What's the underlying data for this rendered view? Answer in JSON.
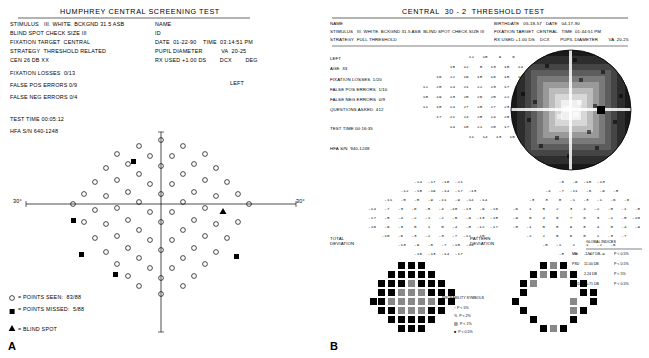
{
  "panelA": {
    "title": "HUMPHREY CENTRAL SCREENING TEST",
    "letter": "A",
    "lines_left": [
      "STIMULUS   III. WHITE. BCKGND 31.5 ASB",
      "BLIND SPOT CHECK SIZE III",
      "FIXATION TARGET  CENTRAL",
      "STRATEGY  THRESHOLD RELATED",
      "CEN 26 DB XX",
      "FALSE POS ERRORS 0/9",
      "FALSE NEG ERRORS 0/4",
      "TEST TIME 00:05:12",
      "HFA S/N 640-1248"
    ],
    "fixation_losses": "FIXATION LOSSES  0/13",
    "lines_right": [
      "NAME",
      "ID",
      "DATE  01-22-90    TIME  03:14:51 PM",
      "PUPIL DIAMETER           VA  20-25",
      "RX USED +1.00 DS        DCX        DEG",
      "LEFT"
    ],
    "axis_left_label": "30°",
    "axis_right_label": "30°",
    "legend": [
      {
        "symbol": "circle",
        "text": "= POINTS SEEN:  83/88"
      },
      {
        "symbol": "square",
        "text": "= POINTS MISSED:  5/88"
      },
      {
        "symbol": "triangle",
        "text": "= BLIND SPOT"
      }
    ]
  },
  "panelB": {
    "title": "CENTRAL  30 - 2  THRESHOLD TEST",
    "letter": "B",
    "header_left": [
      "NAME",
      "STIMULUS   III. WHITE. BCKGND 31.5 ASB  BLIND SPOT CHECK SIZE III",
      "STRATEGY  FULL THRESHOLD"
    ],
    "header_right": [
      "BIRTHDATE   05-18-57   DATE   04-17-90",
      "FIXATION TARGET  CENTRAL   TIME  01:44:51 PM",
      "RX USED +1.00 DS    DCX        PUPIL DIAMETER        VA  20-25"
    ],
    "stats_left": [
      "LEFT",
      "AGE  33",
      "FIXATION LOSSES  1/20",
      "FALSE POS ERRORS  1/10",
      "FALSE NEG ERRORS  0/9",
      "QUESTIONS ASKED  412",
      "TEST TIME 00:16:35",
      "HFA S/N  940-1248"
    ],
    "threshold_label": "THRESHOLD VALUES (dB)",
    "total_deviation_label": "TOTAL\nDEVIATION",
    "pattern_deviation_label": "PATTERN\nDEVIATION",
    "prob_symbols_label": "PROBABILITY SYMBOLS",
    "prob_symbols": [
      ":: P < 5%",
      "%  P < 2%",
      "▨  P < 1%",
      "■  P < 0.5%"
    ],
    "global_label": "GLOBAL INDICES",
    "global_indices": [
      {
        "name": "MD",
        "value": "-17.07 DB",
        "p": "P < 0.5%"
      },
      {
        "name": "PSD",
        "value": "11.00 DB",
        "p": "P < 0.5%"
      },
      {
        "name": "SF",
        "value": "2.24 DB",
        "p": "P < 5%"
      },
      {
        "name": "CPSD",
        "value": "10.71 DB",
        "p": "P < 0.5%"
      }
    ],
    "threshold_rows": [
      "                  12   10    9    6",
      "           15   12    8   13   10   14",
      "      16   22   19   18   16   18   13   13",
      " 12   20   24   21   22   23   17   14   18   11",
      " 10   19   23   25   26   25   22   18   14    9",
      " 11   18   24   27   28   27   23   19   15   10",
      "      17   21   24   25   24   20   16   12",
      "           14   18   21   20   17   13",
      "                  11   14   13   10"
    ],
    "total_dev_rows": [
      "                 -14  -17  -18  -21",
      "            -12  -15  -19  -14  -17  -13",
      "      -11   -5   -8   -9  -11   -9  -14  -14",
      "-14   -7   -3   -6   -5   -4  -10  -13   -9  -16",
      "-17   -8   -4   -2   -1   -2   -5   -9  -13  -18",
      "-16   -9   -3    0    1    0   -4   -8  -12  -17",
      "     -10   -6   -3   -2   -3   -7  -11  -15",
      "           -13   -9   -6   -7  -10  -14",
      "                 -16  -13  -14  -17"
    ],
    "pattern_dev_rows": [
      "                  -6   -9  -10  -13",
      "             -4   -7  -11   -6   -9   -5",
      "       -3    3    0   -1   -3   -1   -6   -6",
      " -6    1    5    2    3    4   -2   -5   -1   -8",
      " -9    0    4    6    7    6    3   -1   -5  -10",
      " -8   -1    5    8    9    8    4    0   -4   -9",
      "      -2    2    5    6    5    1   -3   -7",
      "            -5   -1    2    1   -2   -6",
      "                  -8   -5   -6   -9"
    ]
  }
}
